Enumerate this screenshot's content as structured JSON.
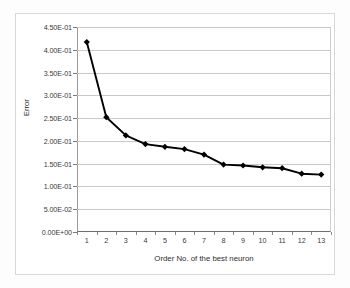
{
  "chart_data": {
    "type": "line",
    "title": "",
    "xlabel": "Order No. of the best neuron",
    "ylabel": "Error",
    "categories": [
      "1",
      "2",
      "3",
      "4",
      "5",
      "6",
      "7",
      "8",
      "9",
      "10",
      "11",
      "12",
      "13"
    ],
    "x": [
      1,
      2,
      3,
      4,
      5,
      6,
      7,
      8,
      9,
      10,
      11,
      12,
      13
    ],
    "values": [
      0.417,
      0.252,
      0.212,
      0.193,
      0.187,
      0.182,
      0.17,
      0.148,
      0.146,
      0.142,
      0.14,
      0.128,
      0.126
    ],
    "series": [
      {
        "name": "Error",
        "values": [
          0.417,
          0.252,
          0.212,
          0.193,
          0.187,
          0.182,
          0.17,
          0.148,
          0.146,
          0.142,
          0.14,
          0.128,
          0.126
        ],
        "marker": "diamond",
        "color": "#000000"
      }
    ],
    "ylim": [
      0.0,
      0.45
    ],
    "xlim": [
      1,
      13
    ],
    "ytick_values": [
      0.0,
      0.05,
      0.1,
      0.15,
      0.2,
      0.25,
      0.3,
      0.35,
      0.4,
      0.45
    ],
    "ytick_labels": [
      "0.00E+00",
      "5.00E-02",
      "1.00E-01",
      "1.50E-01",
      "2.00E-01",
      "2.50E-01",
      "3.00E-01",
      "3.50E-01",
      "4.00E-01",
      "4.50E-01"
    ],
    "grid": "horizontal",
    "legend": "none",
    "gridline_color": "#c9c9c9",
    "axis_color": "#6e6e6e",
    "plot_background": "#ffffff"
  }
}
